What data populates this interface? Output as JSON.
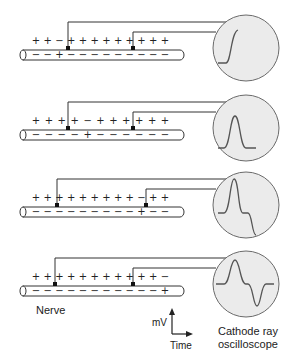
{
  "colors": {
    "line": "#333333",
    "scope_fill": "#ebebeb",
    "scope_stroke": "#6a6a6a",
    "trace": "#555555",
    "nerve_fill": "#ffffff"
  },
  "labels": {
    "nerve": "Nerve",
    "scope_line1": "Cathode ray",
    "scope_line2": "oscilloscope",
    "y_axis": "mV",
    "x_axis": "Time"
  },
  "rows": [
    {
      "outside_charges": [
        "+",
        "+",
        "−",
        "+",
        "+",
        "+",
        "+",
        "+",
        "+",
        "+",
        "+",
        "+"
      ],
      "inside_charges": [
        "−",
        "−",
        "+",
        "−",
        "−",
        "−",
        "−",
        "−",
        "−",
        "−",
        "−",
        "−"
      ],
      "electrode1_x": 68,
      "electrode2_x": 133,
      "trace": "upstroke"
    },
    {
      "outside_charges": [
        "+",
        "+",
        "+",
        "+",
        "−",
        "+",
        "+",
        "+",
        "+",
        "+",
        "+"
      ],
      "inside_charges": [
        "−",
        "−",
        "−",
        "−",
        "+",
        "−",
        "−",
        "−",
        "−",
        "−",
        "−"
      ],
      "electrode1_x": 68,
      "electrode2_x": 133,
      "trace": "positive-peak"
    },
    {
      "outside_charges": [
        "+",
        "+",
        "+",
        "+",
        "+",
        "+",
        "+",
        "+",
        "+",
        "−",
        "+",
        "+"
      ],
      "inside_charges": [
        "−",
        "−",
        "−",
        "−",
        "−",
        "−",
        "−",
        "−",
        "−",
        "+",
        "−",
        "−"
      ],
      "electrode1_x": 57,
      "electrode2_x": 146,
      "trace": "peak-then-downstroke"
    },
    {
      "outside_charges": [
        "+",
        "+",
        "+",
        "+",
        "+",
        "+",
        "+",
        "+",
        "+",
        "+",
        "+",
        "−"
      ],
      "inside_charges": [
        "−",
        "−",
        "−",
        "−",
        "−",
        "−",
        "−",
        "−",
        "−",
        "−",
        "−",
        "+"
      ],
      "electrode1_x": 55,
      "electrode2_x": 133,
      "trace": "biphasic"
    }
  ]
}
